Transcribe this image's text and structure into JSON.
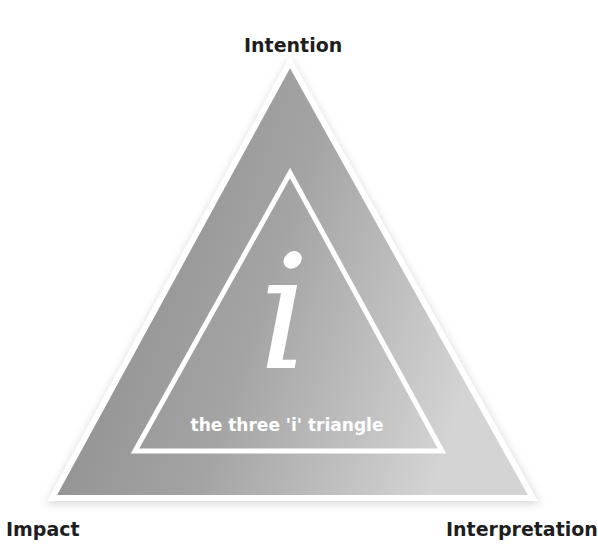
{
  "diagram": {
    "title": "the three 'i' triangle",
    "center_glyph": "i",
    "vertices": {
      "top": "Intention",
      "bottom_left": "Impact",
      "bottom_right": "Interpretation"
    },
    "colors": {
      "fill_dark": "#8a8a8a",
      "fill_light": "#cfcfcf",
      "stroke": "#ffffff",
      "label_text": "#1e1e1e",
      "inner_text": "#ffffff"
    }
  }
}
